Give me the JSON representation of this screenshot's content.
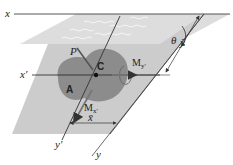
{
  "figure": {
    "colors": {
      "water_surface": "#d9d9d9",
      "plate": "#cfcfcf",
      "area_blob": "#8a8a8a",
      "lines": "#333333",
      "background": "#ffffff"
    }
  },
  "labels": {
    "x_axis": "x",
    "x_prime_axis": "x′",
    "y_axis": "y",
    "y_prime_axis": "y′",
    "force": "P",
    "centroid": "C",
    "area": "A",
    "angle": "θ",
    "x_bar": "x̄",
    "y_bar": "ȳ",
    "moment_y_prime": "M",
    "moment_y_prime_sub": "y′",
    "moment_x_prime": "M",
    "moment_x_prime_sub": "x′"
  }
}
